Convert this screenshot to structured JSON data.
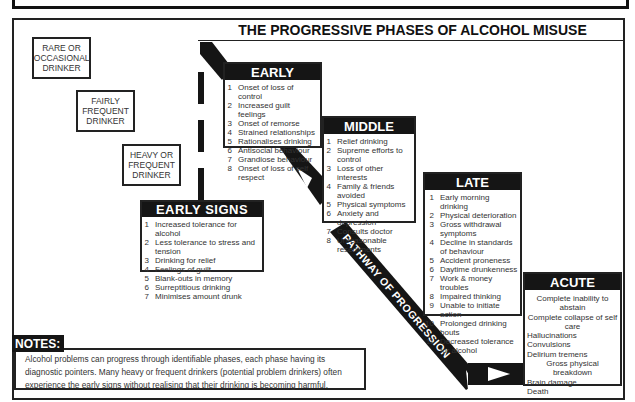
{
  "header": {
    "banner_title": "USE AND MISUSE OF ALCOHOL"
  },
  "main_title": "THE PROGRESSIVE PHASES OF ALCOHOL MISUSE",
  "drinker_types": [
    {
      "label": "RARE OR OCCASIONAL DRINKER"
    },
    {
      "label": "FAIRLY FREQUENT DRINKER"
    },
    {
      "label": "HEAVY OR FREQUENT DRINKER"
    }
  ],
  "pathway_label": "PATHWAY OF PROGRESSION",
  "phases": {
    "early_signs": {
      "title": "EARLY SIGNS",
      "items": [
        {
          "n": "1",
          "t": "Increased tolerance for alcohol"
        },
        {
          "n": "2",
          "t": "Less tolerance to stress and tension"
        },
        {
          "n": "3",
          "t": "Drinking for relief"
        },
        {
          "n": "4",
          "t": "Feelings of guilt"
        },
        {
          "n": "5",
          "t": "Blank-outs in memory"
        },
        {
          "n": "6",
          "t": "Surreptitious drinking"
        },
        {
          "n": "7",
          "t": "Minimises amount drunk"
        }
      ]
    },
    "early": {
      "title": "EARLY",
      "items": [
        {
          "n": "1",
          "t": "Onset of loss of control"
        },
        {
          "n": "2",
          "t": "Increased guilt feelings"
        },
        {
          "n": "3",
          "t": "Onset of remorse"
        },
        {
          "n": "4",
          "t": "Strained relationships"
        },
        {
          "n": "5",
          "t": "Rationalises drinking"
        },
        {
          "n": "6",
          "t": "Antisocial behaviour"
        },
        {
          "n": "7",
          "t": "Grandiose behaviour"
        },
        {
          "n": "8",
          "t": "Onset of loss of self respect"
        }
      ]
    },
    "middle": {
      "title": "MIDDLE",
      "items": [
        {
          "n": "1",
          "t": "Relief drinking"
        },
        {
          "n": "2",
          "t": "Supreme efforts to control"
        },
        {
          "n": "3",
          "t": "Loss of other interests"
        },
        {
          "n": "4",
          "t": "Family & friends avoided"
        },
        {
          "n": "5",
          "t": "Physical symptoms"
        },
        {
          "n": "6",
          "t": "Anxiety and depression"
        },
        {
          "n": "7",
          "t": "Consults doctor"
        },
        {
          "n": "8",
          "t": "Unreasonable resentments"
        }
      ]
    },
    "late": {
      "title": "LATE",
      "items": [
        {
          "n": "1",
          "t": "Early morning drinking"
        },
        {
          "n": "2",
          "t": "Physical deterioration"
        },
        {
          "n": "3",
          "t": "Gross withdrawal symptoms"
        },
        {
          "n": "4",
          "t": "Decline in standards of behaviour"
        },
        {
          "n": "5",
          "t": "Accident proneness"
        },
        {
          "n": "6",
          "t": "Daytime drunkenness"
        },
        {
          "n": "7",
          "t": "Work & money troubles"
        },
        {
          "n": "8",
          "t": "Impaired thinking"
        },
        {
          "n": "9",
          "t": "Unable to initiate action"
        },
        {
          "n": "10",
          "t": "Prolonged drinking bouts"
        },
        {
          "n": "11",
          "t": "Decreased tolerance for alcohol"
        }
      ]
    },
    "acute": {
      "title": "ACUTE",
      "items": [
        "Complete inability to abstain",
        "Complete collapse of self care",
        "Hallucinations",
        "Convulsions",
        "Delirium tremens",
        "Gross physical breakdown",
        "Brain damage",
        "Death"
      ]
    }
  },
  "notes": {
    "label": "NOTES:",
    "text": "Alcohol problems can progress through identifiable phases, each phase having its diagnostic pointers. Many heavy or frequent drinkers (potential problem drinkers) often experience the early signs without realising that their drinking is becoming harmful."
  },
  "colors": {
    "ink": "#151515",
    "paper": "#ffffff",
    "text": "#333333"
  }
}
